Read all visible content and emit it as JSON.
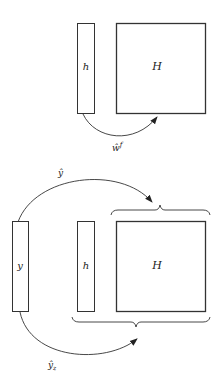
{
  "top_panel": {
    "vector_label": "h",
    "matrix_label": "H",
    "arrow_label": "ŵ",
    "arrow_label_sup": "f"
  },
  "bottom_panel": {
    "y_label": "y",
    "vector_label": "h",
    "matrix_label": "H",
    "top_arrow_label": "ŷ",
    "bottom_arrow_label": "ŷ",
    "bottom_arrow_label_sub": "z"
  },
  "colors": {
    "stroke": "#333333",
    "background": "#ffffff"
  }
}
